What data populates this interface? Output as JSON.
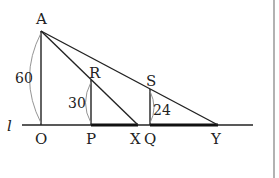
{
  "diagram": {
    "line_label": "l",
    "points": {
      "A": "A",
      "O": "O",
      "P": "P",
      "R": "R",
      "X": "X",
      "Q": "Q",
      "S": "S",
      "Y": "Y"
    },
    "measurements": {
      "AO": "60",
      "RP": "30",
      "SQ": "24"
    },
    "colors": {
      "stroke": "#222222",
      "arc": "#888888",
      "border": "#999999"
    }
  }
}
